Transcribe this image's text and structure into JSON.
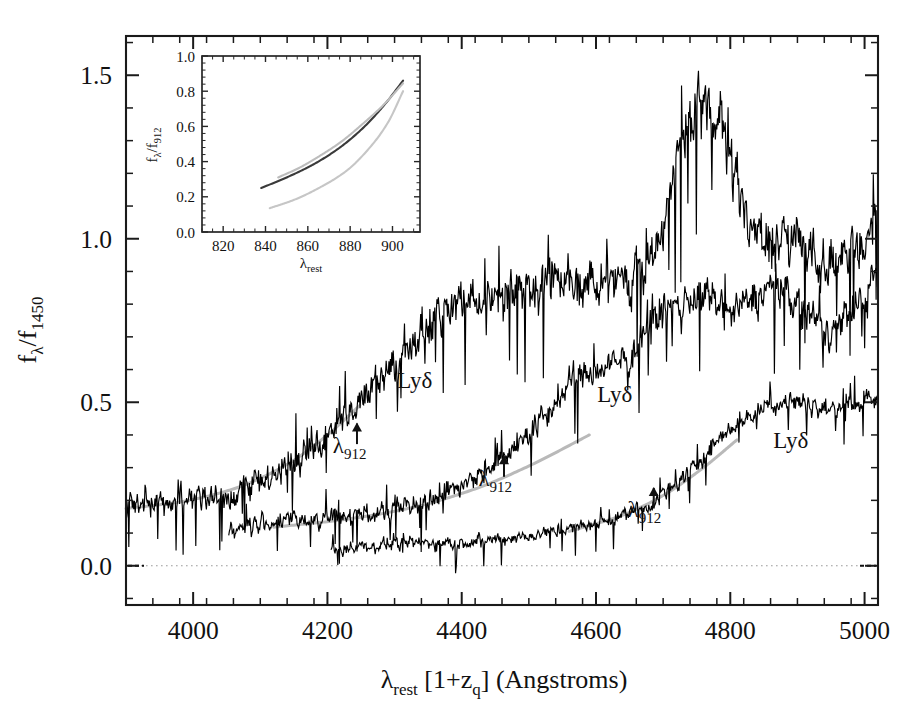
{
  "figure": {
    "type": "spectra-plot",
    "width": 909,
    "height": 718,
    "background": "#ffffff"
  },
  "main_axes": {
    "x_title_main": "λ",
    "x_title_sub1": "rest",
    "x_title_mid": "  [1+z",
    "x_title_sub2": "q",
    "x_title_end": "] (Angstroms)",
    "y_title_main": "f",
    "y_title_sub1": "λ",
    "y_title_mid": "/f",
    "y_title_sub2": "1450",
    "x_ticklabels": [
      "4000",
      "4200",
      "4400",
      "4600",
      "4800",
      "5000"
    ],
    "x_tickvalues": [
      4000,
      4200,
      4400,
      4600,
      4800,
      5000
    ],
    "y_ticklabels": [
      "0.0",
      "0.5",
      "1.0",
      "1.5"
    ],
    "y_tickvalues": [
      0.0,
      0.5,
      1.0,
      1.5
    ],
    "xlim": [
      3900,
      5020
    ],
    "ylim": [
      -0.12,
      1.62
    ],
    "minor_ticks_per_major_x": 4,
    "minor_ticks_per_major_y": 4,
    "zero_line": true,
    "frame_color": "#1a1a1a"
  },
  "inset_axes": {
    "x_title_main": "λ",
    "x_title_sub": "rest",
    "y_title_main": "f",
    "y_title_sub1": "λ",
    "y_title_mid": "/f",
    "y_title_sub2": "912",
    "x_ticklabels": [
      "820",
      "840",
      "860",
      "880",
      "900"
    ],
    "x_tickvalues": [
      820,
      840,
      860,
      880,
      900
    ],
    "y_ticklabels": [
      "0.0",
      "0.2",
      "0.4",
      "0.6",
      "0.8",
      "1.0"
    ],
    "y_tickvalues": [
      0.0,
      0.2,
      0.4,
      0.6,
      0.8,
      1.0
    ],
    "xlim": [
      810,
      913
    ],
    "ylim": [
      0.0,
      1.0
    ]
  },
  "annotations": [
    {
      "name": "lyd-1",
      "text": "Lyδ",
      "x": 4330,
      "y": 0.545
    },
    {
      "name": "lyd-2",
      "text": "Lyδ",
      "x": 4628,
      "y": 0.5
    },
    {
      "name": "lyd-3",
      "text": "Lyδ",
      "x": 4890,
      "y": 0.36
    },
    {
      "name": "lambda912-1",
      "label": "λ",
      "sub": "912",
      "x": 4233,
      "y": 0.345,
      "arrow_x": 4244,
      "arrow_y0": 0.372,
      "arrow_y1": 0.435
    },
    {
      "name": "lambda912-2",
      "label": "λ",
      "sub": "912",
      "x": 4450,
      "y": 0.245,
      "arrow_x": 4463,
      "arrow_y0": 0.272,
      "arrow_y1": 0.335
    },
    {
      "name": "lambda912-3",
      "label": "λ",
      "sub": "912",
      "x": 4672,
      "y": 0.148,
      "arrow_x": 4686,
      "arrow_y0": 0.175,
      "arrow_y1": 0.238
    }
  ],
  "chart_data": {
    "type": "line",
    "title": "",
    "xlabel": "λ_rest [1+z_q] (Angstroms)",
    "ylabel": "f_λ/f_1450",
    "xlim": [
      3900,
      5020
    ],
    "ylim": [
      -0.12,
      1.62
    ],
    "grid": false,
    "legend": null,
    "series": [
      {
        "name": "quasar-spectrum-1",
        "color": "#000000",
        "role": "noisy-spectrum",
        "x_start": 3900,
        "x_end": 5020,
        "comment": "upper spectrum; rises from ~0.18 at 3900 to broad peak ~1.45 near 4760",
        "anchors_x": [
          3900,
          3960,
          4020,
          4080,
          4140,
          4200,
          4260,
          4320,
          4380,
          4440,
          4500,
          4560,
          4620,
          4680,
          4740,
          4770,
          4800,
          4860,
          4900,
          4940,
          4980,
          5020
        ],
        "anchors_y": [
          0.18,
          0.19,
          0.2,
          0.24,
          0.3,
          0.4,
          0.52,
          0.66,
          0.78,
          0.82,
          0.85,
          0.89,
          0.85,
          0.94,
          1.36,
          1.42,
          1.22,
          0.97,
          1.01,
          0.92,
          0.95,
          1.08
        ],
        "noise_amplitude": 0.085
      },
      {
        "name": "quasar-spectrum-2",
        "color": "#000000",
        "role": "noisy-spectrum",
        "x_start": 4053,
        "x_end": 5020,
        "comment": "middle spectrum; starts ~0.10 at 4053, rises to ~0.80-0.90 plateau past 4700",
        "anchors_x": [
          4053,
          4100,
          4160,
          4220,
          4280,
          4340,
          4400,
          4460,
          4520,
          4580,
          4640,
          4700,
          4760,
          4800,
          4860,
          4900,
          4940,
          4980,
          5020
        ],
        "anchors_y": [
          0.1,
          0.13,
          0.14,
          0.15,
          0.17,
          0.2,
          0.25,
          0.33,
          0.45,
          0.58,
          0.62,
          0.78,
          0.82,
          0.77,
          0.85,
          0.81,
          0.72,
          0.78,
          0.88
        ],
        "noise_amplitude": 0.07
      },
      {
        "name": "quasar-spectrum-3",
        "color": "#000000",
        "role": "noisy-spectrum",
        "x_start": 4205,
        "x_end": 5020,
        "comment": "lower spectrum; starts ~0.04 at 4205, rises to ~0.50 plateau past 4800",
        "anchors_x": [
          4205,
          4260,
          4320,
          4380,
          4440,
          4500,
          4560,
          4620,
          4680,
          4740,
          4800,
          4860,
          4900,
          4940,
          4980,
          5020
        ],
        "anchors_y": [
          0.04,
          0.06,
          0.07,
          0.07,
          0.08,
          0.09,
          0.11,
          0.14,
          0.19,
          0.29,
          0.42,
          0.49,
          0.51,
          0.48,
          0.5,
          0.51
        ],
        "noise_amplitude": 0.047
      },
      {
        "name": "powerlaw-fit-1",
        "color": "#b9b9b9",
        "role": "fit-overlay",
        "x_start": 3900,
        "x_end": 4248,
        "anchors_x": [
          3900,
          3980,
          4060,
          4140,
          4200,
          4248
        ],
        "anchors_y": [
          0.175,
          0.195,
          0.235,
          0.31,
          0.4,
          0.49
        ]
      },
      {
        "name": "powerlaw-fit-2",
        "color": "#b9b9b9",
        "role": "fit-overlay",
        "x_start": 4120,
        "x_end": 4590,
        "anchors_x": [
          4120,
          4220,
          4320,
          4420,
          4500,
          4590
        ],
        "anchors_y": [
          0.118,
          0.14,
          0.175,
          0.235,
          0.305,
          0.4
        ]
      },
      {
        "name": "powerlaw-fit-3",
        "color": "#b9b9b9",
        "role": "fit-overlay",
        "x_start": 4560,
        "x_end": 4810,
        "anchors_x": [
          4560,
          4640,
          4700,
          4760,
          4810
        ],
        "anchors_y": [
          0.105,
          0.155,
          0.215,
          0.3,
          0.385
        ]
      }
    ]
  },
  "inset_chart_data": {
    "type": "line",
    "title": "",
    "xlabel": "λ_rest",
    "ylabel": "f_λ/f_912",
    "xlim": [
      810,
      913
    ],
    "ylim": [
      0.0,
      1.0
    ],
    "grid": false,
    "series": [
      {
        "name": "inset-curve-dark",
        "color": "#3a3a3a",
        "x": [
          838,
          850,
          862,
          874,
          886,
          896,
          905
        ],
        "y": [
          0.25,
          0.31,
          0.38,
          0.47,
          0.59,
          0.72,
          0.86
        ]
      },
      {
        "name": "inset-curve-light-upper",
        "color": "#bdbdbd",
        "x": [
          846,
          856,
          866,
          876,
          886,
          896,
          905
        ],
        "y": [
          0.31,
          0.365,
          0.435,
          0.515,
          0.615,
          0.725,
          0.845
        ]
      },
      {
        "name": "inset-curve-light-lower",
        "color": "#c6c6c6",
        "x": [
          842,
          854,
          866,
          878,
          890,
          898,
          905
        ],
        "y": [
          0.135,
          0.185,
          0.255,
          0.345,
          0.49,
          0.625,
          0.8
        ]
      }
    ]
  }
}
